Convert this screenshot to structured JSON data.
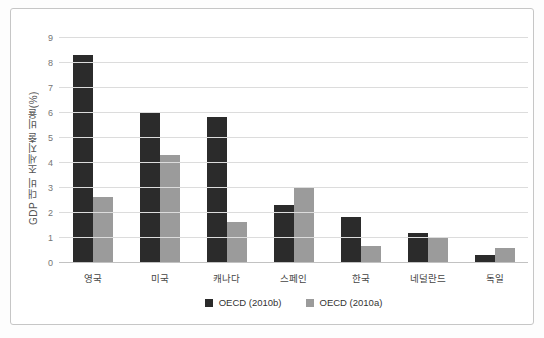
{
  "chart_data": {
    "type": "bar",
    "title": "",
    "xlabel": "",
    "ylabel": "GDP 대비 조세지출 비율(%)",
    "ylim": [
      0,
      9
    ],
    "yticks": [
      0,
      1,
      2,
      3,
      4,
      5,
      6,
      7,
      8,
      9
    ],
    "grid": true,
    "legend_position": "bottom-center",
    "categories": [
      "영국",
      "미국",
      "캐나다",
      "스페인",
      "한국",
      "네덜란드",
      "독일"
    ],
    "series": [
      {
        "name": "OECD (2010b)",
        "color": "#2b2b2b",
        "values": [
          8.3,
          6.0,
          5.8,
          2.3,
          1.8,
          1.15,
          0.3
        ]
      },
      {
        "name": "OECD (2010a)",
        "color": "#9b9b9b",
        "values": [
          2.6,
          4.3,
          1.6,
          3.0,
          0.65,
          0.95,
          0.55
        ]
      }
    ]
  },
  "colors": {
    "frame_border": "#c6c6c6",
    "background": "#ffffff",
    "gridline": "#dcdcdc",
    "baseline": "#c2c2c2",
    "tick_text": "#757575",
    "category_text": "#454545",
    "legend_text": "#333333"
  }
}
